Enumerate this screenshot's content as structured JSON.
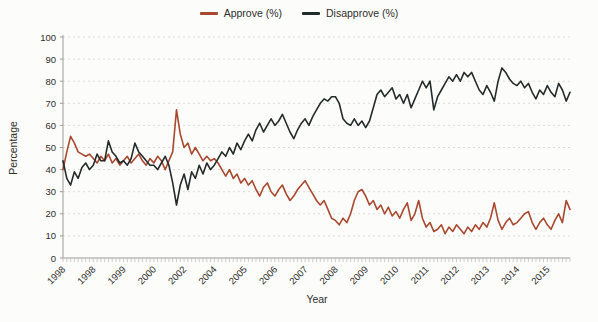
{
  "chart": {
    "xlabel": "Year",
    "ylabel": "Percentage"
  },
  "colors": {
    "background": "#fcfcfa",
    "grid": "#dcdcd7",
    "axis": "#9b9b98",
    "minor_tick": "#b8b8b4",
    "text": "#2e2e2c"
  },
  "chart_data": {
    "type": "line",
    "title": "",
    "xlabel": "Year",
    "ylabel": "Percentage",
    "ylim": [
      0,
      100
    ],
    "yticks": [
      0,
      10,
      20,
      30,
      40,
      50,
      60,
      70,
      80,
      90,
      100
    ],
    "grid": "horizontal dashed, on",
    "legend_position": "top-center",
    "x_tick_labels": [
      "1998",
      "1998",
      "1999",
      "2000",
      "2002",
      "2004",
      "2005",
      "2006",
      "2007",
      "2008",
      "2009",
      "2010",
      "2011",
      "2012",
      "2013",
      "2014",
      "2015"
    ],
    "label_every": 8,
    "x_note": "categorical survey waves, 135 points, minor tick at every point, year label every 8th point",
    "series": [
      {
        "name": "Approve (%)",
        "color": "#a8492f",
        "values": [
          40,
          48,
          55,
          52,
          48,
          47,
          46,
          47,
          45,
          43,
          46,
          44,
          47,
          43,
          45,
          42,
          44,
          46,
          43,
          45,
          47,
          44,
          42,
          45,
          43,
          46,
          44,
          40,
          44,
          48,
          67,
          56,
          50,
          52,
          47,
          50,
          47,
          44,
          46,
          44,
          45,
          43,
          40,
          37,
          40,
          36,
          38,
          34,
          36,
          33,
          35,
          31,
          28,
          32,
          34,
          30,
          28,
          31,
          33,
          29,
          26,
          28,
          31,
          33,
          35,
          32,
          29,
          26,
          24,
          26,
          22,
          18,
          17,
          15,
          18,
          16,
          20,
          26,
          30,
          31,
          28,
          24,
          26,
          22,
          24,
          20,
          23,
          19,
          21,
          18,
          22,
          25,
          17,
          20,
          26,
          18,
          14,
          16,
          12,
          13,
          15,
          11,
          14,
          12,
          15,
          13,
          11,
          14,
          12,
          15,
          13,
          16,
          14,
          18,
          25,
          17,
          13,
          16,
          18,
          15,
          16,
          18,
          20,
          21,
          16,
          13,
          16,
          18,
          15,
          13,
          17,
          20,
          16,
          26,
          22
        ]
      },
      {
        "name": "Disapprove (%)",
        "color": "#232b2b",
        "values": [
          44,
          36,
          33,
          39,
          36,
          41,
          43,
          40,
          42,
          47,
          44,
          44,
          53,
          48,
          46,
          43,
          44,
          42,
          45,
          52,
          48,
          46,
          44,
          42,
          42,
          40,
          43,
          46,
          42,
          34,
          24,
          33,
          38,
          31,
          39,
          36,
          42,
          38,
          43,
          40,
          42,
          45,
          48,
          46,
          50,
          47,
          52,
          49,
          53,
          56,
          53,
          58,
          61,
          57,
          60,
          63,
          60,
          62,
          65,
          61,
          57,
          54,
          58,
          61,
          63,
          60,
          64,
          67,
          70,
          72,
          71,
          73,
          73,
          70,
          63,
          61,
          60,
          63,
          60,
          62,
          59,
          62,
          68,
          74,
          76,
          73,
          75,
          77,
          72,
          74,
          70,
          74,
          68,
          72,
          76,
          80,
          77,
          80,
          67,
          73,
          76,
          79,
          82,
          80,
          83,
          80,
          84,
          82,
          84,
          80,
          76,
          74,
          78,
          75,
          71,
          80,
          86,
          84,
          81,
          79,
          78,
          80,
          77,
          79,
          75,
          72,
          76,
          74,
          78,
          75,
          73,
          79,
          76,
          71,
          75
        ]
      }
    ]
  }
}
